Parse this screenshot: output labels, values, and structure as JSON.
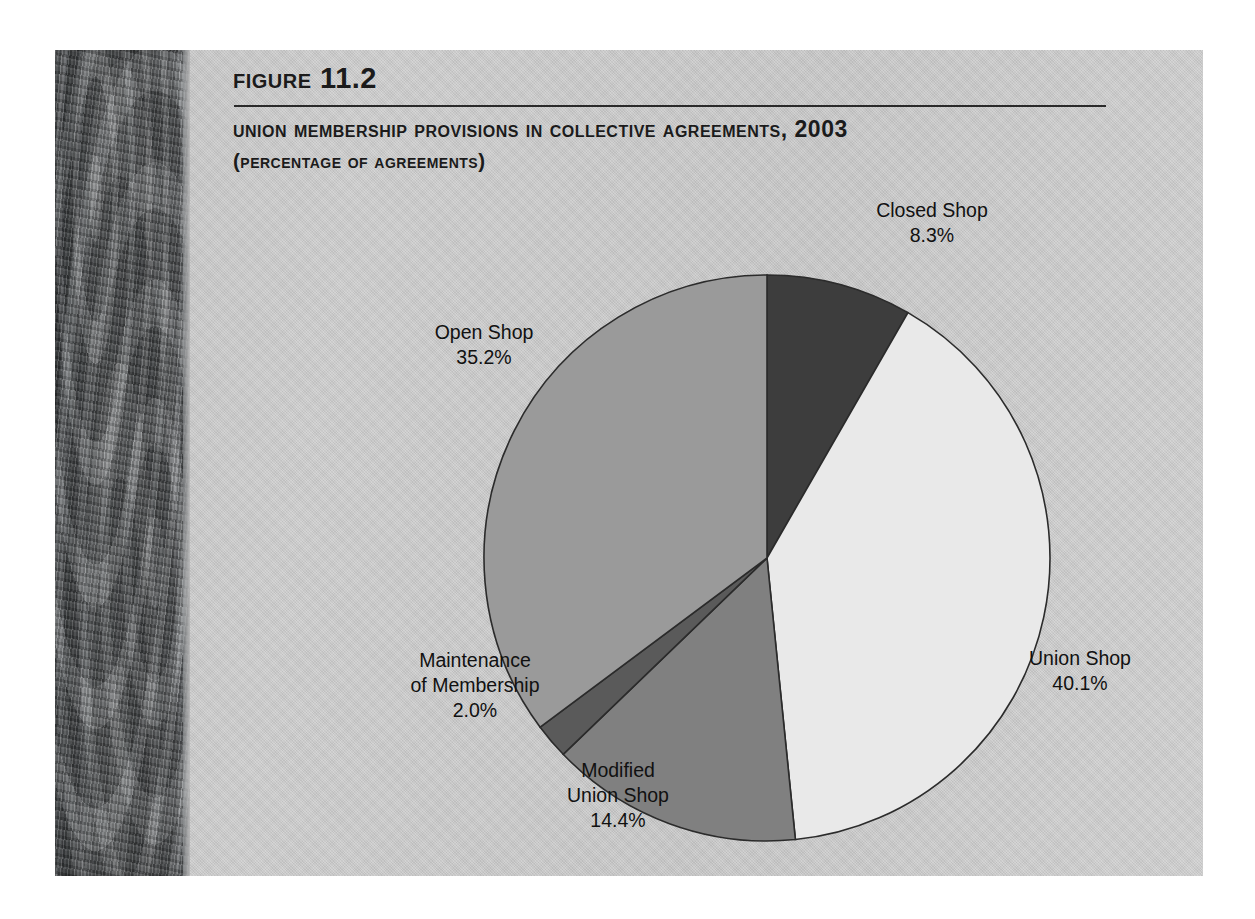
{
  "figure": {
    "number_label": "Figure 11.2",
    "title": "Union Membership Provisions in Collective Agreements, 2003",
    "subtitle": "(percentage of agreements)"
  },
  "colors": {
    "panel_background": "#c9c9c9",
    "spine_strip": "#5e6163",
    "slice_closed_shop": "#3d3d3d",
    "slice_union_shop": "#e9e9e9",
    "slice_modified_union_shop": "#808080",
    "slice_maintenance": "#5a5a5a",
    "slice_open_shop": "#9a9a9a",
    "slice_outline": "#2b2b2b",
    "text": "#111111"
  },
  "chart_data": {
    "type": "pie",
    "title": "Union Membership Provisions in Collective Agreements, 2003",
    "subtitle": "(percentage of agreements)",
    "unit": "%",
    "start_angle_deg": 0,
    "direction": "clockwise",
    "legend": "none (direct labels)",
    "categories": [
      "Closed Shop",
      "Union Shop",
      "Modified Union Shop",
      "Maintenance of Membership",
      "Open Shop"
    ],
    "values": [
      8.3,
      40.1,
      14.4,
      2.0,
      35.2
    ],
    "slices": [
      {
        "name": "Closed Shop",
        "value": 8.3,
        "label": "Closed Shop",
        "value_label": "8.3%",
        "color": "#3d3d3d",
        "start_deg": 0,
        "end_deg": 29.88
      },
      {
        "name": "Union Shop",
        "value": 40.1,
        "label": "Union Shop",
        "value_label": "40.1%",
        "color": "#e9e9e9",
        "start_deg": 29.88,
        "end_deg": 174.24
      },
      {
        "name": "Modified Union Shop",
        "value": 14.4,
        "label": "Modified\nUnion Shop",
        "label_line1": "Modified",
        "label_line2": "Union Shop",
        "value_label": "14.4%",
        "color": "#808080",
        "start_deg": 174.24,
        "end_deg": 226.08
      },
      {
        "name": "Maintenance of Membership",
        "value": 2.0,
        "label": "Maintenance of Membership",
        "label_line1": "Maintenance",
        "label_line2": "of Membership",
        "value_label": "2.0%",
        "color": "#5a5a5a",
        "start_deg": 226.08,
        "end_deg": 233.28
      },
      {
        "name": "Open Shop",
        "value": 35.2,
        "label": "Open Shop",
        "value_label": "35.2%",
        "color": "#9a9a9a",
        "start_deg": 233.28,
        "end_deg": 360.0
      }
    ]
  }
}
